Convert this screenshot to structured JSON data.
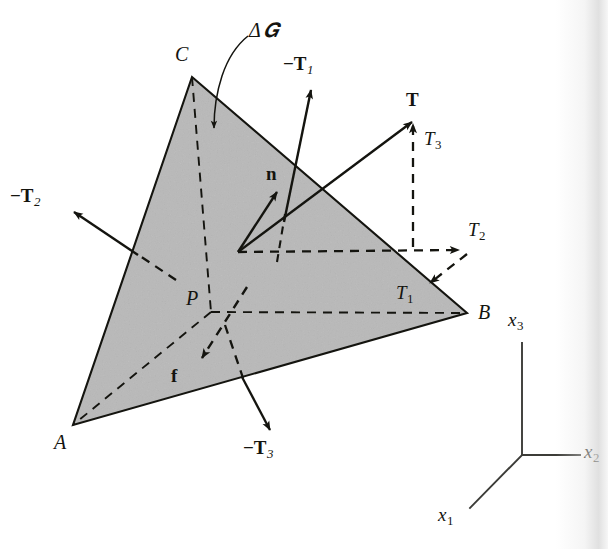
{
  "figure": {
    "background_color": "#ffffff",
    "face_fill_color": "#b8b8b8",
    "line_color": "#14140f"
  },
  "vertices": [
    {
      "name": "vertex-c",
      "label": "C",
      "x": 192,
      "y": 77,
      "label_x": 175,
      "label_y": 44
    },
    {
      "name": "vertex-a",
      "label": "A",
      "x": 73,
      "y": 425,
      "label_x": 54,
      "label_y": 432
    },
    {
      "name": "vertex-b",
      "label": "B",
      "x": 467,
      "y": 313,
      "label_x": 478,
      "label_y": 302
    },
    {
      "name": "vertex-p",
      "label": "P",
      "x": 211,
      "y": 312,
      "label_x": 186,
      "label_y": 288
    }
  ],
  "surface_label": {
    "name": "delta-s-label",
    "delta": "Δ",
    "script_s": "𝑮",
    "text": "Δ S",
    "x": 249,
    "y": 20
  },
  "vectors": [
    {
      "name": "traction-vector-T",
      "label": "T",
      "style": "solid",
      "label_x": 406,
      "label_y": 90,
      "tail": [
        238,
        252
      ],
      "tip": [
        412,
        122
      ]
    },
    {
      "name": "normal-vector-n",
      "label": "n",
      "style": "solid",
      "label_x": 266,
      "label_y": 164,
      "tail": [
        238,
        252
      ],
      "tip": [
        277,
        192
      ]
    },
    {
      "name": "component-T3",
      "label": "T",
      "subscript": "3",
      "style": "dashed",
      "label_x": 424,
      "label_y": 129,
      "tail": [
        413,
        247
      ],
      "tip": [
        413,
        122
      ]
    },
    {
      "name": "component-T2",
      "label": "T",
      "subscript": "2",
      "style": "dashed",
      "label_x": 468,
      "label_y": 220,
      "tail": [
        238,
        252
      ],
      "tip": [
        461,
        250
      ]
    },
    {
      "name": "component-T1",
      "label": "T",
      "subscript": "1",
      "style": "dashed",
      "label_x": 396,
      "label_y": 283,
      "tail": [
        466,
        254
      ],
      "tip": [
        428,
        284
      ]
    },
    {
      "name": "reaction-vector-neg-T1",
      "label": "−T",
      "subscript": "1",
      "style": "solid",
      "label_x": 283,
      "label_y": 54,
      "tail": [
        283,
        222
      ],
      "tip": [
        311,
        89
      ]
    },
    {
      "name": "reaction-vector-neg-T2",
      "label": "−T",
      "subscript": "2",
      "style": "solid",
      "label_x": 10,
      "label_y": 186,
      "tail": [
        137,
        254
      ],
      "tip": [
        72,
        211
      ]
    },
    {
      "name": "reaction-vector-neg-T3",
      "label": "−T",
      "subscript": "3",
      "style": "solid",
      "label_x": 243,
      "label_y": 438,
      "tail": [
        241,
        376
      ],
      "tip": [
        269,
        429
      ]
    },
    {
      "name": "body-force-vector-f",
      "label": "f",
      "style": "dashed",
      "label_x": 171,
      "label_y": 366,
      "tail": [
        246,
        288
      ],
      "tip": [
        200,
        359
      ]
    }
  ],
  "axes": {
    "name": "coordinate-axes",
    "origin": [
      522,
      455
    ],
    "items": [
      {
        "name": "axis-x3",
        "label": "x",
        "subscript": "3",
        "tip": [
          522,
          343
        ],
        "label_x": 508,
        "label_y": 310
      },
      {
        "name": "axis-x2",
        "label": "x",
        "subscript": "2",
        "tip": [
          580,
          455
        ],
        "label_x": 584,
        "label_y": 442
      },
      {
        "name": "axis-x1",
        "label": "x",
        "subscript": "1",
        "tip": [
          470,
          508
        ],
        "label_x": 438,
        "label_y": 505
      }
    ]
  }
}
